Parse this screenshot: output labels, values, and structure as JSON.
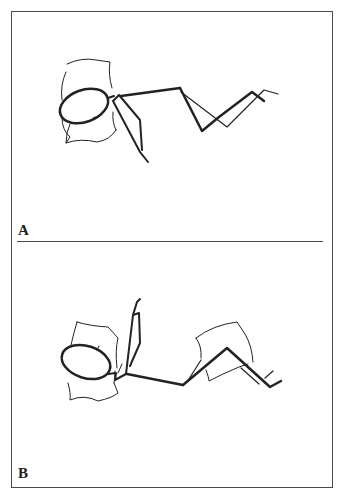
{
  "figure": {
    "panels": [
      {
        "id": "A",
        "label": "A",
        "description": "Stick figure lying supine with head on pillow, arm at side, knees bent"
      },
      {
        "id": "B",
        "label": "B",
        "description": "Stick figure lying supine with head on pillow, arm raised overhead, pillow under knees"
      }
    ],
    "colors": {
      "line": "#222222",
      "border": "#4a4a4a",
      "background": "#ffffff"
    }
  }
}
